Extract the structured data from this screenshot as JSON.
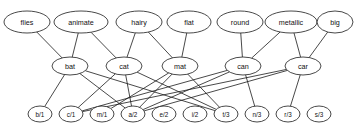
{
  "diagram": {
    "type": "layered-node-link-graph",
    "title": "",
    "background_color": "#ffffff",
    "node_fill": "#ffffff",
    "node_stroke": "#1a1a1a",
    "edge_color": "#1a1a1a",
    "layers": [
      {
        "name": "features",
        "nodes": [
          {
            "id": "flies",
            "label": "flies",
            "cx": 27,
            "cy": 22,
            "rx": 23,
            "ry": 11
          },
          {
            "id": "animate",
            "label": "animate",
            "cx": 81,
            "cy": 22,
            "rx": 27,
            "ry": 11
          },
          {
            "id": "hairy",
            "label": "hairy",
            "cx": 139,
            "cy": 22,
            "rx": 23,
            "ry": 11
          },
          {
            "id": "flat",
            "label": "flat",
            "cx": 189,
            "cy": 22,
            "rx": 22,
            "ry": 11
          },
          {
            "id": "round",
            "label": "round",
            "cx": 240,
            "cy": 22,
            "rx": 23,
            "ry": 11
          },
          {
            "id": "metallic",
            "label": "metallic",
            "cx": 291,
            "cy": 22,
            "rx": 26,
            "ry": 11
          },
          {
            "id": "big",
            "label": "big",
            "cx": 335,
            "cy": 22,
            "rx": 18,
            "ry": 11
          }
        ]
      },
      {
        "name": "words",
        "nodes": [
          {
            "id": "bat",
            "label": "bat",
            "cx": 70,
            "cy": 66,
            "rx": 18,
            "ry": 9
          },
          {
            "id": "cat",
            "label": "cat",
            "cx": 124,
            "cy": 66,
            "rx": 18,
            "ry": 9
          },
          {
            "id": "mat",
            "label": "mat",
            "cx": 180,
            "cy": 66,
            "rx": 18,
            "ry": 9
          },
          {
            "id": "can",
            "label": "can",
            "cx": 243,
            "cy": 66,
            "rx": 18,
            "ry": 9
          },
          {
            "id": "car",
            "label": "car",
            "cx": 303,
            "cy": 66,
            "rx": 18,
            "ry": 9
          }
        ]
      },
      {
        "name": "letter-slots",
        "nodes": [
          {
            "id": "b1",
            "label": "b/1",
            "cx": 40,
            "cy": 114,
            "rx": 12,
            "ry": 8
          },
          {
            "id": "c1",
            "label": "c/1",
            "cx": 71,
            "cy": 114,
            "rx": 12,
            "ry": 8
          },
          {
            "id": "m1",
            "label": "m/1",
            "cx": 102,
            "cy": 114,
            "rx": 12,
            "ry": 8
          },
          {
            "id": "a2",
            "label": "a/2",
            "cx": 133,
            "cy": 114,
            "rx": 12,
            "ry": 8
          },
          {
            "id": "e2",
            "label": "e/2",
            "cx": 164,
            "cy": 114,
            "rx": 12,
            "ry": 8
          },
          {
            "id": "i2",
            "label": "i/2",
            "cx": 195,
            "cy": 114,
            "rx": 12,
            "ry": 8
          },
          {
            "id": "t3",
            "label": "t/3",
            "cx": 226,
            "cy": 114,
            "rx": 12,
            "ry": 8
          },
          {
            "id": "n3",
            "label": "n/3",
            "cx": 257,
            "cy": 114,
            "rx": 12,
            "ry": 8
          },
          {
            "id": "r3",
            "label": "r/3",
            "cx": 288,
            "cy": 114,
            "rx": 12,
            "ry": 8
          },
          {
            "id": "s3",
            "label": "s/3",
            "cx": 319,
            "cy": 114,
            "rx": 12,
            "ry": 8
          }
        ]
      }
    ],
    "edges": [
      {
        "from": "flies",
        "to": "bat"
      },
      {
        "from": "animate",
        "to": "bat"
      },
      {
        "from": "animate",
        "to": "cat"
      },
      {
        "from": "hairy",
        "to": "cat"
      },
      {
        "from": "hairy",
        "to": "mat"
      },
      {
        "from": "flat",
        "to": "mat"
      },
      {
        "from": "round",
        "to": "can"
      },
      {
        "from": "metallic",
        "to": "can"
      },
      {
        "from": "metallic",
        "to": "car"
      },
      {
        "from": "big",
        "to": "car"
      },
      {
        "from": "bat",
        "to": "b1"
      },
      {
        "from": "bat",
        "to": "a2"
      },
      {
        "from": "bat",
        "to": "t3"
      },
      {
        "from": "cat",
        "to": "c1"
      },
      {
        "from": "cat",
        "to": "a2"
      },
      {
        "from": "cat",
        "to": "t3"
      },
      {
        "from": "mat",
        "to": "m1"
      },
      {
        "from": "mat",
        "to": "a2"
      },
      {
        "from": "mat",
        "to": "t3"
      },
      {
        "from": "can",
        "to": "c1"
      },
      {
        "from": "can",
        "to": "a2"
      },
      {
        "from": "can",
        "to": "n3"
      },
      {
        "from": "car",
        "to": "c1"
      },
      {
        "from": "car",
        "to": "a2"
      },
      {
        "from": "car",
        "to": "r3"
      }
    ]
  }
}
